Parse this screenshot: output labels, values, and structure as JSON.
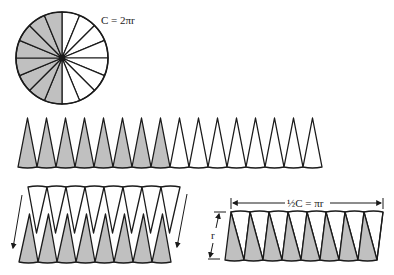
{
  "diagram": {
    "colors": {
      "shaded": "#c0c0c0",
      "unshaded": "#ffffff",
      "line": "#1a1a1a",
      "background": "#ffffff"
    },
    "circle": {
      "cx": 62,
      "cy": 58,
      "r": 46,
      "sectors": 16,
      "shaded_sectors": 8,
      "label": "C = 2πr"
    },
    "strip": {
      "triangles": 16,
      "shaded_count": 8,
      "x0": 18,
      "x1": 322,
      "apex_y": 118,
      "base_y": 167
    },
    "interleave": {
      "pairs": 8,
      "arrow_count": 2,
      "description": "Unshaded triangles inverted and slid down between shaded triangles"
    },
    "parallelogram": {
      "pairs": 8,
      "width_label": "½C = πr",
      "height_label": "r"
    }
  }
}
